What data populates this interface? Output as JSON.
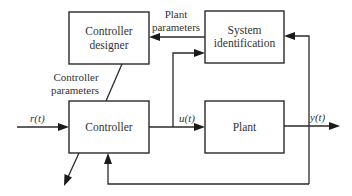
{
  "diagram": {
    "blocks": {
      "controller_designer": {
        "line1": "Controller",
        "line2": "designer"
      },
      "system_identification": {
        "line1": "System",
        "line2": "identification"
      },
      "controller": {
        "label": "Controller"
      },
      "plant": {
        "label": "Plant"
      }
    },
    "edge_labels": {
      "plant_parameters": {
        "line1": "Plant",
        "line2": "parameters"
      },
      "controller_parameters": {
        "line1": "Controller",
        "line2": "parameters"
      }
    },
    "signals": {
      "reference": "r(t)",
      "control": "u(t)",
      "output": "y(t)"
    },
    "colors": {
      "stroke": "#2a2a2a",
      "text": "#333333",
      "background": "#ffffff"
    }
  }
}
